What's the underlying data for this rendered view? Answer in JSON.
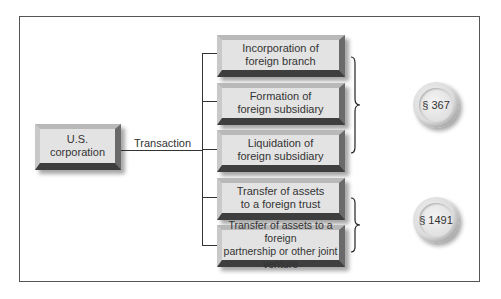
{
  "diagram": {
    "source": {
      "label": "U.S.\ncorporation"
    },
    "connector_label": "Transaction",
    "transactions": [
      {
        "label": "Incorporation of\nforeign branch",
        "section_group": "367"
      },
      {
        "label": "Formation of\nforeign subsidiary",
        "section_group": "367"
      },
      {
        "label": "Liquidation of\nforeign subsidiary",
        "section_group": "367"
      },
      {
        "label": "Transfer of assets\nto a foreign trust",
        "section_group": "1491"
      },
      {
        "label": "Transfer of assets to a foreign\npartnership or other joint venture",
        "section_group": "1491"
      }
    ],
    "sections": [
      {
        "id": "367",
        "label": "§ 367"
      },
      {
        "id": "1491",
        "label": "§ 1491"
      }
    ]
  },
  "colors": {
    "box_face": "#e3e3e3",
    "box_shadow": "#3e3e3e",
    "line": "#333333",
    "frame": "#555555"
  }
}
